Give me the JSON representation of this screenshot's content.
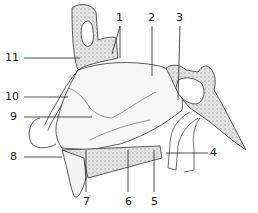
{
  "diagram": {
    "labels": [
      {
        "id": "1",
        "text": "1",
        "x": 118,
        "y": 14,
        "anchor": "top"
      },
      {
        "id": "2",
        "text": "2",
        "x": 148,
        "y": 14,
        "anchor": "top"
      },
      {
        "id": "3",
        "text": "3",
        "x": 176,
        "y": 14,
        "anchor": "top"
      },
      {
        "id": "4",
        "text": "4",
        "x": 213,
        "y": 153,
        "anchor": "right"
      },
      {
        "id": "5",
        "text": "5",
        "x": 151,
        "y": 203,
        "anchor": "bottom"
      },
      {
        "id": "6",
        "text": "6",
        "x": 127,
        "y": 203,
        "anchor": "bottom"
      },
      {
        "id": "7",
        "text": "7",
        "x": 84,
        "y": 203,
        "anchor": "bottom"
      },
      {
        "id": "8",
        "text": "8",
        "x": 13,
        "y": 157,
        "anchor": "left"
      },
      {
        "id": "9",
        "text": "9",
        "x": 13,
        "y": 117,
        "anchor": "left"
      },
      {
        "id": "10",
        "text": "10",
        "x": 10,
        "y": 97,
        "anchor": "left"
      },
      {
        "id": "11",
        "text": "11",
        "x": 10,
        "y": 58,
        "anchor": "left"
      }
    ],
    "colors": {
      "line": "#333333",
      "bone_fill": "#d9d9d9",
      "soft_fill": "#f4f4f4",
      "background": "#ffffff"
    }
  }
}
